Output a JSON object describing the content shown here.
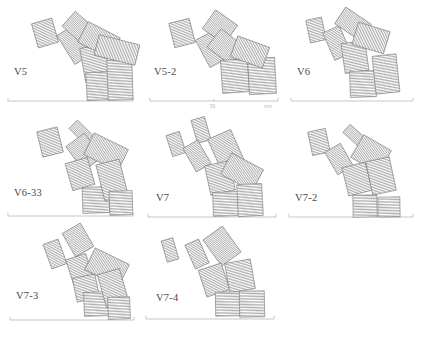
{
  "figure": {
    "type": "technical-line-drawing",
    "block_fill": "#ffffff",
    "hatch_color": "#8a8a8a",
    "outline_color": "#6e6e6e",
    "baseline_color": "#b9b9b9",
    "label_color": "#4a4a4a"
  },
  "scale_bar": {
    "panel": "V5-2",
    "mid_tick_label": "50",
    "unit_label": "mm"
  },
  "panels": [
    {
      "id": "v5",
      "label": "V5",
      "label_left": 14,
      "label_top": 66,
      "baseline": {
        "x1": 8,
        "x2": 133,
        "y": 101
      },
      "blocks": [
        {
          "cx": 45,
          "cy": 33,
          "w": 21,
          "h": 25,
          "rot": -16
        },
        {
          "cx": 74,
          "cy": 45,
          "w": 19,
          "h": 34,
          "rot": -32
        },
        {
          "cx": 78,
          "cy": 27,
          "w": 20,
          "h": 25,
          "rot": -48
        },
        {
          "cx": 95,
          "cy": 63,
          "w": 25,
          "h": 34,
          "rot": -10
        },
        {
          "cx": 99,
          "cy": 40,
          "w": 23,
          "h": 36,
          "rot": -63
        },
        {
          "cx": 100,
          "cy": 86,
          "w": 27,
          "h": 28,
          "rot": -3
        },
        {
          "cx": 120,
          "cy": 80,
          "w": 25,
          "h": 40,
          "rot": -2
        },
        {
          "cx": 117,
          "cy": 50,
          "w": 21,
          "h": 42,
          "rot": -76
        }
      ]
    },
    {
      "id": "v5-2",
      "label": "V5-2",
      "label_left": 14,
      "label_top": 66,
      "baseline": {
        "x1": 10,
        "x2": 138,
        "y": 101
      },
      "blocks": [
        {
          "cx": 42,
          "cy": 33,
          "w": 21,
          "h": 25,
          "rot": -14
        },
        {
          "cx": 72,
          "cy": 49,
          "w": 21,
          "h": 31,
          "rot": -28
        },
        {
          "cx": 80,
          "cy": 27,
          "w": 23,
          "h": 27,
          "rot": -55
        },
        {
          "cx": 86,
          "cy": 47,
          "w": 23,
          "h": 30,
          "rot": -52
        },
        {
          "cx": 95,
          "cy": 76,
          "w": 27,
          "h": 33,
          "rot": -4
        },
        {
          "cx": 122,
          "cy": 76,
          "w": 27,
          "h": 36,
          "rot": -3
        },
        {
          "cx": 110,
          "cy": 52,
          "w": 22,
          "h": 34,
          "rot": -70
        }
      ]
    },
    {
      "id": "v6",
      "label": "V6",
      "label_left": 12,
      "label_top": 66,
      "baseline": {
        "x1": 6,
        "x2": 128,
        "y": 101
      },
      "blocks": [
        {
          "cx": 31,
          "cy": 30,
          "w": 16,
          "h": 23,
          "rot": -12
        },
        {
          "cx": 52,
          "cy": 43,
          "w": 18,
          "h": 30,
          "rot": -24
        },
        {
          "cx": 68,
          "cy": 24,
          "w": 20,
          "h": 31,
          "rot": -56
        },
        {
          "cx": 70,
          "cy": 57,
          "w": 24,
          "h": 30,
          "rot": -8
        },
        {
          "cx": 86,
          "cy": 38,
          "w": 23,
          "h": 33,
          "rot": -73
        },
        {
          "cx": 78,
          "cy": 84,
          "w": 26,
          "h": 26,
          "rot": -2
        },
        {
          "cx": 101,
          "cy": 74,
          "w": 24,
          "h": 38,
          "rot": -6
        }
      ]
    },
    {
      "id": "v6-33",
      "label": "V6-33",
      "label_left": 14,
      "label_top": 75,
      "baseline": {
        "x1": 8,
        "x2": 133,
        "y": 104
      },
      "blocks": [
        {
          "cx": 50,
          "cy": 30,
          "w": 21,
          "h": 26,
          "rot": -14
        },
        {
          "cx": 81,
          "cy": 20,
          "w": 12,
          "h": 22,
          "rot": -45
        },
        {
          "cx": 84,
          "cy": 40,
          "w": 23,
          "h": 30,
          "rot": -36
        },
        {
          "cx": 80,
          "cy": 62,
          "w": 23,
          "h": 28,
          "rot": -16
        },
        {
          "cx": 106,
          "cy": 40,
          "w": 24,
          "h": 38,
          "rot": -64
        },
        {
          "cx": 96,
          "cy": 88,
          "w": 27,
          "h": 26,
          "rot": -2
        },
        {
          "cx": 112,
          "cy": 68,
          "w": 24,
          "h": 37,
          "rot": -14
        },
        {
          "cx": 121,
          "cy": 91,
          "w": 23,
          "h": 24,
          "rot": -2
        }
      ]
    },
    {
      "id": "v7",
      "label": "V7",
      "label_left": 16,
      "label_top": 80,
      "baseline": {
        "x1": 8,
        "x2": 136,
        "y": 105
      },
      "blocks": [
        {
          "cx": 36,
          "cy": 32,
          "w": 14,
          "h": 22,
          "rot": -18
        },
        {
          "cx": 61,
          "cy": 18,
          "w": 14,
          "h": 24,
          "rot": -16
        },
        {
          "cx": 57,
          "cy": 44,
          "w": 17,
          "h": 27,
          "rot": -30
        },
        {
          "cx": 86,
          "cy": 38,
          "w": 25,
          "h": 34,
          "rot": -24
        },
        {
          "cx": 80,
          "cy": 66,
          "w": 25,
          "h": 30,
          "rot": -12
        },
        {
          "cx": 102,
          "cy": 60,
          "w": 24,
          "h": 36,
          "rot": -62
        },
        {
          "cx": 86,
          "cy": 92,
          "w": 26,
          "h": 24,
          "rot": -2
        },
        {
          "cx": 110,
          "cy": 88,
          "w": 25,
          "h": 32,
          "rot": -3
        }
      ]
    },
    {
      "id": "v7-2",
      "label": "V7-2",
      "label_left": 10,
      "label_top": 80,
      "baseline": {
        "x1": 4,
        "x2": 128,
        "y": 105
      },
      "blocks": [
        {
          "cx": 34,
          "cy": 30,
          "w": 18,
          "h": 24,
          "rot": -12
        },
        {
          "cx": 70,
          "cy": 24,
          "w": 11,
          "h": 23,
          "rot": -48
        },
        {
          "cx": 54,
          "cy": 47,
          "w": 18,
          "h": 26,
          "rot": -30
        },
        {
          "cx": 86,
          "cy": 42,
          "w": 26,
          "h": 32,
          "rot": -60
        },
        {
          "cx": 72,
          "cy": 67,
          "w": 24,
          "h": 29,
          "rot": -14
        },
        {
          "cx": 96,
          "cy": 64,
          "w": 24,
          "h": 34,
          "rot": -12
        },
        {
          "cx": 80,
          "cy": 94,
          "w": 24,
          "h": 22,
          "rot": -1
        },
        {
          "cx": 104,
          "cy": 95,
          "w": 22,
          "h": 20,
          "rot": -1
        }
      ]
    },
    {
      "id": "v7-3",
      "label": "V7-3",
      "label_left": 16,
      "label_top": 68,
      "baseline": {
        "x1": 10,
        "x2": 134,
        "y": 98
      },
      "blocks": [
        {
          "cx": 55,
          "cy": 32,
          "w": 16,
          "h": 26,
          "rot": -20
        },
        {
          "cx": 78,
          "cy": 18,
          "w": 21,
          "h": 27,
          "rot": -30
        },
        {
          "cx": 80,
          "cy": 48,
          "w": 21,
          "h": 28,
          "rot": -18
        },
        {
          "cx": 86,
          "cy": 66,
          "w": 23,
          "h": 24,
          "rot": -12
        },
        {
          "cx": 107,
          "cy": 45,
          "w": 24,
          "h": 38,
          "rot": -64
        },
        {
          "cx": 97,
          "cy": 82,
          "w": 26,
          "h": 24,
          "rot": -2
        },
        {
          "cx": 113,
          "cy": 66,
          "w": 23,
          "h": 34,
          "rot": -16
        },
        {
          "cx": 119,
          "cy": 86,
          "w": 22,
          "h": 22,
          "rot": -2
        }
      ]
    },
    {
      "id": "v7-4",
      "label": "V7-4",
      "label_left": 16,
      "label_top": 70,
      "baseline": {
        "x1": 6,
        "x2": 134,
        "y": 97
      },
      "blocks": [
        {
          "cx": 30,
          "cy": 28,
          "w": 12,
          "h": 22,
          "rot": -16
        },
        {
          "cx": 57,
          "cy": 32,
          "w": 15,
          "h": 26,
          "rot": -24
        },
        {
          "cx": 82,
          "cy": 24,
          "w": 24,
          "h": 32,
          "rot": -36
        },
        {
          "cx": 74,
          "cy": 58,
          "w": 24,
          "h": 28,
          "rot": -18
        },
        {
          "cx": 100,
          "cy": 54,
          "w": 26,
          "h": 30,
          "rot": -10
        },
        {
          "cx": 88,
          "cy": 82,
          "w": 25,
          "h": 24,
          "rot": -1
        },
        {
          "cx": 112,
          "cy": 82,
          "w": 25,
          "h": 26,
          "rot": -1
        }
      ]
    }
  ]
}
